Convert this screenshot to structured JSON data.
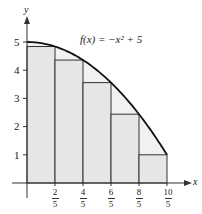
{
  "chart_data": {
    "type": "area",
    "title": "f(x) = −x² + 5",
    "function": "f(x) = -x^2 + 5",
    "xlabel": "x",
    "ylabel": "y",
    "xlim": [
      0,
      2.2
    ],
    "ylim": [
      0,
      5.5
    ],
    "grid": false,
    "x_ticks": [
      {
        "value": 0.4,
        "num": "2",
        "den": "5"
      },
      {
        "value": 0.8,
        "num": "4",
        "den": "5"
      },
      {
        "value": 1.2,
        "num": "6",
        "den": "5"
      },
      {
        "value": 1.6,
        "num": "8",
        "den": "5"
      },
      {
        "value": 2.0,
        "num": "10",
        "den": "5"
      }
    ],
    "y_ticks": [
      1,
      2,
      3,
      4,
      5
    ],
    "rectangles": {
      "method": "right endpoint (inscribed)",
      "width": 0.4,
      "x_left": [
        0,
        0.4,
        0.8,
        1.2,
        1.6
      ],
      "heights": [
        4.84,
        4.36,
        3.56,
        2.44,
        1.0
      ]
    },
    "curve_domain": [
      0,
      2
    ],
    "colors": {
      "fill": "#e6e6e6",
      "curve": "#111111",
      "rect_stroke": "#333333",
      "axis": "#333333"
    }
  },
  "labels": {
    "function_label": "f(x) = −x² + 5",
    "x_axis": "x",
    "y_axis": "y",
    "y_tick_1": "1",
    "y_tick_2": "2",
    "y_tick_3": "3",
    "y_tick_4": "4",
    "y_tick_5": "5",
    "x_tick_0_num": "2",
    "x_tick_0_den": "5",
    "x_tick_1_num": "4",
    "x_tick_1_den": "5",
    "x_tick_2_num": "6",
    "x_tick_2_den": "5",
    "x_tick_3_num": "8",
    "x_tick_3_den": "5",
    "x_tick_4_num": "10",
    "x_tick_4_den": "5"
  }
}
